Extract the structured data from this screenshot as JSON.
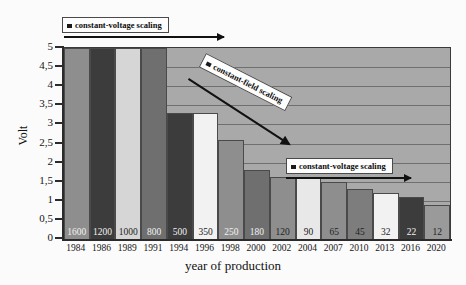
{
  "chart_data": {
    "type": "bar",
    "title": "",
    "xlabel": "year of production",
    "ylabel": "Volt",
    "ylim": [
      0,
      5
    ],
    "ytick_labels": [
      "5",
      "4,5",
      "4",
      "3,5",
      "3",
      "2,5",
      "2",
      "1,5",
      "1",
      "0,5",
      "0"
    ],
    "ytick_values": [
      5,
      4.5,
      4,
      3.5,
      3,
      2.5,
      2,
      1.5,
      1,
      0.5,
      0
    ],
    "grid": true,
    "legend_position": "inside-annotations",
    "categories": [
      "1984",
      "1986",
      "1989",
      "1991",
      "1994",
      "1996",
      "1998",
      "2000",
      "2002",
      "2004",
      "2007",
      "2010",
      "2013",
      "2016",
      "2020"
    ],
    "values": [
      5,
      5,
      5,
      5,
      3.3,
      3.3,
      2.6,
      1.8,
      1.62,
      1.62,
      1.5,
      1.3,
      1.2,
      1.1,
      0.9
    ],
    "bar_labels": [
      "1600",
      "1200",
      "1000",
      "800",
      "500",
      "350",
      "250",
      "180",
      "120",
      "90",
      "65",
      "45",
      "32",
      "22",
      "12"
    ],
    "bar_label_note": "technology node in nanometers",
    "bar_colors": [
      "#8e8e8e",
      "#3c3c3c",
      "#d6d6d6",
      "#6f6f6f",
      "#3c3c3c",
      "#f2f2f2",
      "#8e8e8e",
      "#6f6f6f",
      "#8e8e8e",
      "#e8e8e8",
      "#8e8e8e",
      "#7d7d7d",
      "#f2f2f2",
      "#3c3c3c",
      "#9a9a9a"
    ],
    "bar_label_colors": [
      "#f2f2f2",
      "#f2f2f2",
      "#222222",
      "#f2f2f2",
      "#f2f2f2",
      "#222222",
      "#f2f2f2",
      "#f2f2f2",
      "#222222",
      "#222222",
      "#222222",
      "#222222",
      "#222222",
      "#f2f2f2",
      "#222222"
    ],
    "annotations": [
      {
        "text": "constant-voltage scaling",
        "position": "top-left"
      },
      {
        "text": "constant-field scaling",
        "position": "middle-diagonal"
      },
      {
        "text": "constant-voltage scaling",
        "position": "lower-right"
      }
    ],
    "plot_background": "#a9a9a9",
    "axis_color": "#2b2b2b"
  }
}
